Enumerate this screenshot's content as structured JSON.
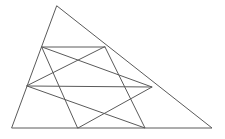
{
  "figure": {
    "type": "line-diagram",
    "canvas": {
      "width": 225,
      "height": 139
    },
    "background_color": "#ffffff",
    "default_stroke_color": "#5a5a5a",
    "default_stroke_width": 1,
    "points": {
      "apex": {
        "label": "A",
        "x": 57,
        "y": 6
      },
      "bottom_left": {
        "label": "B",
        "x": 12,
        "y": 128
      },
      "bottom_right": {
        "label": "C",
        "x": 212,
        "y": 128
      },
      "upper_left": {
        "label": "D",
        "x": 42,
        "y": 47
      },
      "upper_right": {
        "label": "E",
        "x": 105,
        "y": 47
      },
      "mid_left": {
        "label": "F",
        "x": 27,
        "y": 86
      },
      "mid_right": {
        "label": "G",
        "x": 152,
        "y": 87
      },
      "base_left": {
        "label": "H",
        "x": 78,
        "y": 128
      },
      "base_right": {
        "label": "I",
        "x": 145,
        "y": 128
      }
    },
    "shapes": [
      {
        "name": "outer-triangle",
        "kind": "polygon",
        "vertices": [
          "apex",
          "bottom_right",
          "bottom_left"
        ],
        "stroke_color": "#5a5a5a",
        "stroke_width": 1
      },
      {
        "name": "inner-triangle-one",
        "kind": "polygon",
        "vertices": [
          "upper_left",
          "mid_right",
          "base_left"
        ],
        "stroke_color": "#5a5a5a",
        "stroke_width": 1
      },
      {
        "name": "inner-triangle-two",
        "kind": "polygon",
        "vertices": [
          "upper_right",
          "base_right",
          "mid_left"
        ],
        "stroke_color": "#5a5a5a",
        "stroke_width": 1
      },
      {
        "name": "chord-upper",
        "kind": "segment",
        "vertices": [
          "upper_left",
          "upper_right"
        ],
        "stroke_color": "#5a5a5a",
        "stroke_width": 1
      },
      {
        "name": "chord-middle",
        "kind": "segment",
        "vertices": [
          "mid_left",
          "mid_right"
        ],
        "stroke_color": "#5a5a5a",
        "stroke_width": 1
      }
    ],
    "labels": []
  }
}
